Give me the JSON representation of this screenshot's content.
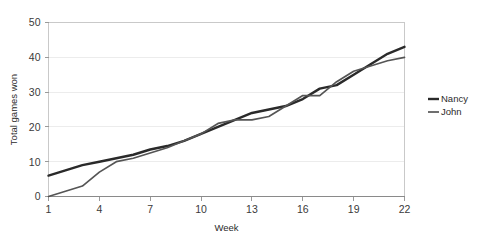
{
  "chart_data": {
    "type": "line",
    "title": "",
    "xlabel": "Week",
    "ylabel": "Total games won",
    "xlim": [
      1,
      22
    ],
    "ylim": [
      0,
      50
    ],
    "xticks": [
      1,
      4,
      7,
      10,
      13,
      16,
      19,
      22
    ],
    "yticks": [
      0,
      10,
      20,
      30,
      40,
      50
    ],
    "grid": "horizontal",
    "legend_position": "right",
    "x": [
      1,
      2,
      3,
      4,
      5,
      6,
      7,
      8,
      9,
      10,
      11,
      12,
      13,
      14,
      15,
      16,
      17,
      18,
      19,
      20,
      21,
      22
    ],
    "series": [
      {
        "name": "Nancy",
        "color": "#2a2a2a",
        "width": 2.4,
        "values": [
          6,
          7.5,
          9,
          10,
          11,
          12,
          13.5,
          14.5,
          16,
          18,
          20,
          22,
          24,
          25,
          26,
          28,
          31,
          32,
          35,
          38,
          41,
          43
        ]
      },
      {
        "name": "John",
        "color": "#555555",
        "width": 1.7,
        "values": [
          0,
          1.5,
          3,
          7,
          10,
          11,
          12.5,
          14,
          16,
          18,
          21,
          22,
          22,
          23,
          26,
          29,
          29,
          33,
          36,
          37.5,
          39,
          40
        ]
      }
    ]
  },
  "legend": {
    "items": [
      {
        "label": "Nancy"
      },
      {
        "label": "John"
      }
    ]
  },
  "axis": {
    "x_title": "Week",
    "y_title": "Total games won",
    "x_tick_labels": [
      "1",
      "4",
      "7",
      "10",
      "13",
      "16",
      "19",
      "22"
    ],
    "y_tick_labels": [
      "0",
      "10",
      "20",
      "30",
      "40",
      "50"
    ]
  }
}
